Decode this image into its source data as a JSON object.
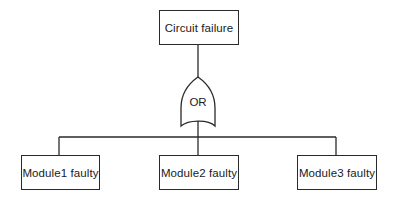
{
  "diagram": {
    "type": "fault-tree",
    "top_event": {
      "label": "Circuit failure"
    },
    "gate": {
      "type": "OR",
      "label": "OR"
    },
    "basic_events": [
      {
        "label": "Module1 faulty"
      },
      {
        "label": "Module2 faulty"
      },
      {
        "label": "Module3 faulty"
      }
    ],
    "colors": {
      "line": "#2a2a2a",
      "background": "#ffffff"
    }
  }
}
